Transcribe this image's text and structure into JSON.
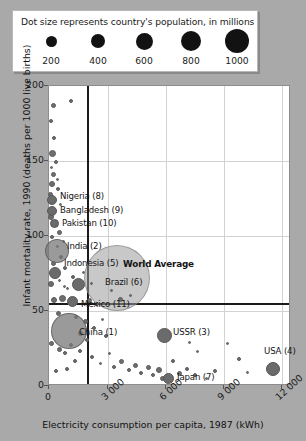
{
  "legend": {
    "title": "Dot size represents country's population, in millions",
    "items": [
      {
        "value": "200",
        "px": 38,
        "diameter": 11
      },
      {
        "value": "400",
        "px": 85,
        "diameter": 14
      },
      {
        "value": "600",
        "px": 131,
        "diameter": 17
      },
      {
        "value": "800",
        "px": 178,
        "diameter": 20
      },
      {
        "value": "1000",
        "px": 224,
        "diameter": 24
      }
    ]
  },
  "axes": {
    "y_title": "Infant mortality rate, 1990 (deaths per 1000 live births)",
    "x_title": "Electricity consumption per capita, 1987 (kWh)",
    "y_ticks": [
      "200",
      "150",
      "100",
      "50",
      "0"
    ],
    "x_ticks": [
      "0",
      "3 000",
      "6 000",
      "9 000",
      "12 000"
    ]
  },
  "annotations": {
    "world_average": "World Average"
  },
  "chart_data": {
    "type": "scatter",
    "title": "",
    "subtitle": "",
    "xlabel": "Electricity consumption per capita, 1987 (kWh)",
    "ylabel": "Infant mortality rate, 1990 (deaths per 1000 live births)",
    "xlim": [
      0,
      12600
    ],
    "ylim": [
      0,
      200
    ],
    "xticks": [
      0,
      3000,
      6000,
      9000,
      12000
    ],
    "yticks": [
      0,
      50,
      100,
      150,
      200
    ],
    "grid": true,
    "legend_position": "top-outside",
    "size_encoding": {
      "variable": "population (millions)",
      "legend_values": [
        200,
        400,
        600,
        800,
        1000
      ]
    },
    "reference_lines": {
      "label": "World Average",
      "x": 1900,
      "y": 63
    },
    "labeled_points": [
      {
        "label": "China (1)",
        "rank": 1,
        "x": 480,
        "y": 42,
        "pop": 1100,
        "px": 68,
        "py": 330,
        "d": 36,
        "lx": 78,
        "ly": 331
      },
      {
        "label": "India (2)",
        "rank": 2,
        "x": 230,
        "y": 95,
        "pop": 850,
        "px": 56,
        "py": 250,
        "d": 24,
        "lx": 66,
        "ly": 245
      },
      {
        "label": "USSR (3)",
        "rank": 3,
        "x": 5400,
        "y": 25,
        "pop": 290,
        "px": 163,
        "py": 334,
        "d": 15,
        "lx": 172,
        "ly": 331
      },
      {
        "label": "USA (4)",
        "rank": 4,
        "x": 11200,
        "y": 10,
        "pop": 250,
        "px": 272,
        "py": 368,
        "d": 14,
        "lx": 263,
        "ly": 350
      },
      {
        "label": "Indonesia (5)",
        "rank": 5,
        "x": 170,
        "y": 75,
        "pop": 180,
        "px": 54,
        "py": 272,
        "d": 12,
        "lx": 63,
        "ly": 262
      },
      {
        "label": "Brazil (6)",
        "rank": 6,
        "x": 1500,
        "y": 60,
        "pop": 150,
        "px": 77,
        "py": 283,
        "d": 13,
        "lx": 104,
        "ly": 281
      },
      {
        "label": "Japan (7)",
        "rank": 7,
        "x": 5800,
        "y": 5,
        "pop": 124,
        "px": 167,
        "py": 377,
        "d": 11,
        "lx": 176,
        "ly": 376
      },
      {
        "label": "Nigeria (8)",
        "rank": 8,
        "x": 90,
        "y": 120,
        "pop": 110,
        "px": 51,
        "py": 199,
        "d": 10,
        "lx": 59,
        "ly": 195
      },
      {
        "label": "Bangladesh (9)",
        "rank": 9,
        "x": 55,
        "y": 113,
        "pop": 108,
        "px": 51,
        "py": 210,
        "d": 10,
        "lx": 59,
        "ly": 209
      },
      {
        "label": "Pakistan (10)",
        "rank": 10,
        "x": 200,
        "y": 108,
        "pop": 105,
        "px": 53,
        "py": 222,
        "d": 9,
        "lx": 61,
        "ly": 222
      },
      {
        "label": "Mexico (11)",
        "rank": 11,
        "x": 1100,
        "y": 47,
        "pop": 85,
        "px": 71,
        "py": 300,
        "d": 11,
        "lx": 80,
        "ly": 303
      }
    ],
    "average_marker": {
      "px": 116,
      "py": 277,
      "d": 66
    },
    "other_points": [
      {
        "px": 52,
        "py": 104,
        "d": 5
      },
      {
        "px": 50,
        "py": 120,
        "d": 4
      },
      {
        "px": 53,
        "py": 137,
        "d": 4
      },
      {
        "px": 51,
        "py": 152,
        "d": 7
      },
      {
        "px": 55,
        "py": 161,
        "d": 4
      },
      {
        "px": 50,
        "py": 166,
        "d": 3
      },
      {
        "px": 52,
        "py": 173,
        "d": 5
      },
      {
        "px": 56,
        "py": 178,
        "d": 3
      },
      {
        "px": 51,
        "py": 183,
        "d": 6
      },
      {
        "px": 57,
        "py": 188,
        "d": 4
      },
      {
        "px": 49,
        "py": 193,
        "d": 5
      },
      {
        "px": 59,
        "py": 203,
        "d": 3
      },
      {
        "px": 50,
        "py": 216,
        "d": 6
      },
      {
        "px": 58,
        "py": 231,
        "d": 5
      },
      {
        "px": 51,
        "py": 236,
        "d": 4
      },
      {
        "px": 62,
        "py": 240,
        "d": 3
      },
      {
        "px": 52,
        "py": 262,
        "d": 5
      },
      {
        "px": 64,
        "py": 267,
        "d": 4
      },
      {
        "px": 58,
        "py": 279,
        "d": 3
      },
      {
        "px": 50,
        "py": 283,
        "d": 6
      },
      {
        "px": 66,
        "py": 287,
        "d": 3
      },
      {
        "px": 72,
        "py": 276,
        "d": 4
      },
      {
        "px": 82,
        "py": 271,
        "d": 3
      },
      {
        "px": 90,
        "py": 282,
        "d": 3
      },
      {
        "px": 110,
        "py": 289,
        "d": 3
      },
      {
        "px": 119,
        "py": 298,
        "d": 5
      },
      {
        "px": 61,
        "py": 297,
        "d": 7
      },
      {
        "px": 53,
        "py": 299,
        "d": 6
      },
      {
        "px": 88,
        "py": 299,
        "d": 5
      },
      {
        "px": 96,
        "py": 303,
        "d": 4
      },
      {
        "px": 57,
        "py": 312,
        "d": 5
      },
      {
        "px": 75,
        "py": 316,
        "d": 4
      },
      {
        "px": 84,
        "py": 320,
        "d": 5
      },
      {
        "px": 93,
        "py": 327,
        "d": 4
      },
      {
        "px": 101,
        "py": 318,
        "d": 3
      },
      {
        "px": 50,
        "py": 342,
        "d": 5
      },
      {
        "px": 58,
        "py": 348,
        "d": 5
      },
      {
        "px": 64,
        "py": 352,
        "d": 4
      },
      {
        "px": 70,
        "py": 344,
        "d": 4
      },
      {
        "px": 79,
        "py": 350,
        "d": 4
      },
      {
        "px": 91,
        "py": 356,
        "d": 4
      },
      {
        "px": 99,
        "py": 362,
        "d": 3
      },
      {
        "px": 108,
        "py": 352,
        "d": 3
      },
      {
        "px": 113,
        "py": 366,
        "d": 4
      },
      {
        "px": 120,
        "py": 360,
        "d": 5
      },
      {
        "px": 128,
        "py": 369,
        "d": 4
      },
      {
        "px": 134,
        "py": 364,
        "d": 5
      },
      {
        "px": 140,
        "py": 372,
        "d": 4
      },
      {
        "px": 147,
        "py": 366,
        "d": 5
      },
      {
        "px": 152,
        "py": 374,
        "d": 4
      },
      {
        "px": 158,
        "py": 369,
        "d": 6
      },
      {
        "px": 161,
        "py": 377,
        "d": 5
      },
      {
        "px": 172,
        "py": 360,
        "d": 4
      },
      {
        "px": 178,
        "py": 372,
        "d": 5
      },
      {
        "px": 186,
        "py": 368,
        "d": 4
      },
      {
        "px": 194,
        "py": 374,
        "d": 4
      },
      {
        "px": 205,
        "py": 377,
        "d": 3
      },
      {
        "px": 214,
        "py": 370,
        "d": 4
      },
      {
        "px": 226,
        "py": 342,
        "d": 3
      },
      {
        "px": 238,
        "py": 358,
        "d": 4
      },
      {
        "px": 246,
        "py": 371,
        "d": 3
      },
      {
        "px": 196,
        "py": 350,
        "d": 3
      },
      {
        "px": 188,
        "py": 341,
        "d": 3
      },
      {
        "px": 105,
        "py": 335,
        "d": 4
      },
      {
        "px": 86,
        "py": 339,
        "d": 4
      },
      {
        "px": 74,
        "py": 360,
        "d": 4
      },
      {
        "px": 66,
        "py": 368,
        "d": 4
      },
      {
        "px": 55,
        "py": 370,
        "d": 4
      },
      {
        "px": 79,
        "py": 332,
        "d": 5
      },
      {
        "px": 70,
        "py": 100,
        "d": 4
      },
      {
        "px": 56,
        "py": 245,
        "d": 3
      },
      {
        "px": 60,
        "py": 256,
        "d": 4
      },
      {
        "px": 63,
        "py": 285,
        "d": 3
      },
      {
        "px": 129,
        "py": 294,
        "d": 3
      }
    ]
  }
}
